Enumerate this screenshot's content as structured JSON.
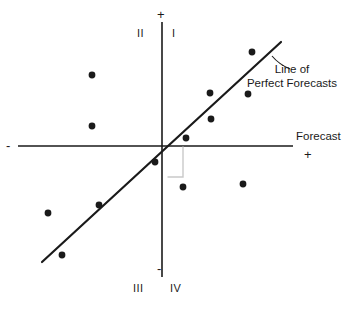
{
  "figure": {
    "width": 347,
    "height": 309,
    "background": "#ffffff",
    "ink_color": "#1a1a1a",
    "faint_color": "#c9c9c9"
  },
  "axes": {
    "origin": {
      "x": 162,
      "y": 146
    },
    "horizontal": {
      "x1": 18,
      "y1": 146,
      "x2": 293,
      "y2": 146
    },
    "vertical": {
      "x1": 162,
      "y1": 22,
      "x2": 162,
      "y2": 277
    },
    "x_axis_title": "Forecast",
    "x_positive_sign": "+",
    "x_negative_sign": "-",
    "y_positive_sign": "+",
    "y_negative_sign": "-"
  },
  "quadrants": [
    {
      "id": "q2",
      "label": "II",
      "x": 136,
      "y": 33
    },
    {
      "id": "q1",
      "label": "I",
      "x": 172,
      "y": 33
    },
    {
      "id": "q3",
      "label": "III",
      "x": 133,
      "y": 284
    },
    {
      "id": "q4",
      "label": "IV",
      "x": 170,
      "y": 284
    }
  ],
  "reference_line": {
    "name": "Line of Perfect Forecasts",
    "label_lines": [
      "Line of",
      "Perfect Forecasts"
    ],
    "label_x": 246,
    "label_y": 64,
    "x1": 42,
    "y1": 262,
    "x2": 281,
    "y2": 42,
    "stroke_width": 2.2,
    "leader": {
      "x1": 272,
      "y1": 56,
      "x2": 289,
      "y2": 68
    }
  },
  "deviation_bracket": {
    "name": "forecast-error-bracket",
    "color": "#c9c9c9",
    "path": "M 183 147 L 183 177 L 168 177",
    "stroke_width": 1.4
  },
  "chart_data": {
    "type": "scatter",
    "title": "",
    "xlabel": "Forecast",
    "ylabel": "",
    "grid": false,
    "legend": "none",
    "axis_style": "four-quadrant cartesian, unlabeled scale",
    "xlim": [
      -1,
      1
    ],
    "ylim": [
      -1,
      1
    ],
    "series": [
      {
        "name": "Observations",
        "marker": "filled-circle",
        "marker_radius": 3.4,
        "color": "#1a1a1a",
        "points_px": [
          {
            "x": 92,
            "y": 75,
            "quadrant": "II"
          },
          {
            "x": 92,
            "y": 126,
            "quadrant": "II"
          },
          {
            "x": 252,
            "y": 52,
            "quadrant": "I"
          },
          {
            "x": 210,
            "y": 93,
            "quadrant": "I"
          },
          {
            "x": 248,
            "y": 94,
            "quadrant": "I"
          },
          {
            "x": 211,
            "y": 119,
            "quadrant": "I"
          },
          {
            "x": 186,
            "y": 138,
            "quadrant": "I"
          },
          {
            "x": 155,
            "y": 162,
            "quadrant": "III"
          },
          {
            "x": 183,
            "y": 187,
            "quadrant": "IV"
          },
          {
            "x": 243,
            "y": 184,
            "quadrant": "IV"
          },
          {
            "x": 99,
            "y": 205,
            "quadrant": "III"
          },
          {
            "x": 48,
            "y": 213,
            "quadrant": "III"
          },
          {
            "x": 62,
            "y": 255,
            "quadrant": "III"
          }
        ],
        "points_data": [
          {
            "x": -0.55,
            "y": 0.54
          },
          {
            "x": -0.55,
            "y": 0.15
          },
          {
            "x": 0.69,
            "y": 0.72
          },
          {
            "x": 0.37,
            "y": 0.41
          },
          {
            "x": 0.66,
            "y": 0.4
          },
          {
            "x": 0.38,
            "y": 0.21
          },
          {
            "x": 0.18,
            "y": 0.06
          },
          {
            "x": -0.05,
            "y": -0.12
          },
          {
            "x": 0.17,
            "y": -0.31
          },
          {
            "x": 0.62,
            "y": -0.29
          },
          {
            "x": -0.49,
            "y": -0.45
          },
          {
            "x": -0.88,
            "y": -0.51
          },
          {
            "x": -0.78,
            "y": -0.83
          }
        ]
      }
    ],
    "annotations": [
      {
        "text": "Line of Perfect Forecasts",
        "kind": "reference-line-label"
      },
      {
        "text": "Forecast",
        "kind": "x-axis-title"
      },
      {
        "text": "I",
        "kind": "quadrant"
      },
      {
        "text": "II",
        "kind": "quadrant"
      },
      {
        "text": "III",
        "kind": "quadrant"
      },
      {
        "text": "IV",
        "kind": "quadrant"
      }
    ]
  }
}
